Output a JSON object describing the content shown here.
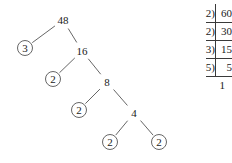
{
  "diagram": {
    "stroke_color": "#555555",
    "text_color": "#1a1a1a",
    "background": "#ffffff"
  },
  "factor_tree": {
    "root_label": "48",
    "nodes": [
      {
        "id": "n48",
        "label": "48",
        "x": 63,
        "y": 20,
        "circled": false
      },
      {
        "id": "n3",
        "label": "3",
        "x": 25,
        "y": 48,
        "circled": true
      },
      {
        "id": "n16",
        "label": "16",
        "x": 82,
        "y": 51,
        "circled": false
      },
      {
        "id": "n2a",
        "label": "2",
        "x": 53,
        "y": 79,
        "circled": true
      },
      {
        "id": "n8",
        "label": "8",
        "x": 107,
        "y": 82,
        "circled": false
      },
      {
        "id": "n2b",
        "label": "2",
        "x": 79,
        "y": 110,
        "circled": true
      },
      {
        "id": "n4",
        "label": "4",
        "x": 134,
        "y": 113,
        "circled": false
      },
      {
        "id": "n2c",
        "label": "2",
        "x": 110,
        "y": 142,
        "circled": true
      },
      {
        "id": "n2d",
        "label": "2",
        "x": 159,
        "y": 142,
        "circled": true
      }
    ],
    "edges": [
      {
        "from": "n48",
        "to": "n3"
      },
      {
        "from": "n48",
        "to": "n16"
      },
      {
        "from": "n16",
        "to": "n2a"
      },
      {
        "from": "n16",
        "to": "n8"
      },
      {
        "from": "n8",
        "to": "n2b"
      },
      {
        "from": "n8",
        "to": "n4"
      },
      {
        "from": "n4",
        "to": "n2c"
      },
      {
        "from": "n4",
        "to": "n2d"
      }
    ]
  },
  "division_ladder": {
    "rows": [
      {
        "divisor": "2",
        "bracket": ")",
        "dividend": "60"
      },
      {
        "divisor": "2",
        "bracket": ")",
        "dividend": "30"
      },
      {
        "divisor": "3",
        "bracket": ")",
        "dividend": "15"
      },
      {
        "divisor": "5",
        "bracket": ")",
        "dividend": "5"
      }
    ],
    "final_quotient": "1"
  }
}
